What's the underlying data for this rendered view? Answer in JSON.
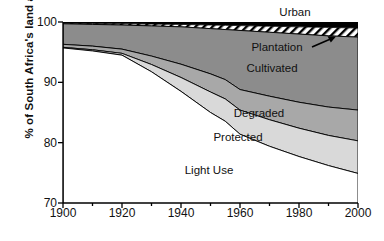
{
  "chart_data": {
    "type": "area",
    "title": "",
    "subtitle": "",
    "xlabel": "",
    "ylabel": "% of South Africa's land area",
    "xlim": [
      1900,
      2000
    ],
    "ylim": [
      70,
      100
    ],
    "grid": false,
    "legend_position": "inline-annotations",
    "stacked": true,
    "stack_order": "top-down",
    "x": [
      1900,
      1910,
      1920,
      1930,
      1940,
      1950,
      1955,
      1960,
      1970,
      1980,
      1990,
      2000
    ],
    "xticks": [
      1900,
      1920,
      1940,
      1960,
      1980,
      2000
    ],
    "xminorticks": [
      1910,
      1930,
      1950,
      1970,
      1990
    ],
    "yticks": [
      70,
      80,
      90,
      100
    ],
    "series": [
      {
        "name": "Urban",
        "color": "#000000",
        "pattern": "solid",
        "values": [
          0.2,
          0.25,
          0.3,
          0.35,
          0.4,
          0.5,
          0.55,
          0.6,
          0.7,
          0.8,
          0.9,
          1.0
        ]
      },
      {
        "name": "Plantation",
        "color": "#ffffff",
        "pattern": "diagonal-hatch",
        "values": [
          0.1,
          0.15,
          0.2,
          0.3,
          0.4,
          0.6,
          0.7,
          0.8,
          1.0,
          1.2,
          1.4,
          1.5
        ]
      },
      {
        "name": "Cultivated",
        "color": "#8c8c8c",
        "pattern": "solid",
        "values": [
          3.4,
          3.6,
          4.0,
          5.0,
          6.2,
          7.5,
          8.3,
          9.8,
          10.6,
          11.3,
          11.8,
          12.1
        ]
      },
      {
        "name": "Degraded",
        "color": "#a8a8a8",
        "pattern": "solid",
        "values": [
          0.5,
          0.6,
          0.7,
          1.4,
          2.2,
          3.0,
          3.2,
          3.4,
          3.9,
          4.3,
          4.7,
          5.1
        ]
      },
      {
        "name": "Protected",
        "color": "#d9d9d9",
        "pattern": "solid",
        "values": [
          0.1,
          0.2,
          0.3,
          1.2,
          2.3,
          3.4,
          3.7,
          4.0,
          4.4,
          4.7,
          5.0,
          5.4
        ]
      },
      {
        "name": "Light Use",
        "color": "#ffffff",
        "pattern": "solid",
        "values": [
          95.7,
          95.2,
          94.5,
          91.75,
          88.5,
          85.0,
          83.55,
          81.4,
          79.4,
          77.7,
          76.2,
          74.9
        ]
      }
    ],
    "boundaries_cumulative_from_top": {
      "urban_bottom": [
        99.8,
        99.75,
        99.7,
        99.65,
        99.6,
        99.5,
        99.45,
        99.4,
        99.3,
        99.2,
        99.1,
        99.0
      ],
      "plantation_bottom": [
        99.7,
        99.6,
        99.5,
        99.35,
        99.2,
        98.9,
        98.75,
        98.6,
        98.3,
        98.0,
        97.7,
        97.5
      ],
      "cultivated_bottom": [
        96.3,
        96.0,
        95.5,
        94.35,
        93.0,
        91.4,
        90.45,
        88.8,
        87.7,
        86.7,
        85.9,
        85.4
      ],
      "degraded_bottom": [
        95.8,
        95.4,
        94.8,
        92.95,
        90.8,
        88.4,
        87.25,
        85.4,
        83.8,
        82.4,
        81.2,
        80.3
      ],
      "protected_bottom": [
        95.7,
        95.2,
        94.5,
        91.75,
        88.5,
        85.0,
        83.55,
        81.4,
        79.4,
        77.7,
        76.2,
        74.9
      ]
    },
    "annotations": [
      {
        "text": "Urban",
        "x": 1978,
        "y": 101.6,
        "target": "urban-band"
      },
      {
        "text": "Plantation",
        "x": 1972,
        "y": 96.6,
        "target": "plantation-band",
        "arrow": true
      },
      {
        "text": "Cultivated",
        "x": 1963,
        "y": 92.7,
        "target": "cultivated-band"
      },
      {
        "text": "Degraded",
        "x": 1958,
        "y": 85.4,
        "target": "degraded-band"
      },
      {
        "text": "Protected",
        "x": 1950,
        "y": 81.6,
        "target": "protected-band"
      },
      {
        "text": "Light Use",
        "x": 1938,
        "y": 76.3,
        "target": "light-use-band"
      }
    ]
  },
  "axis": {
    "y_label": "% of South Africa's land area",
    "y_ticks": [
      "100",
      "90",
      "80",
      "70"
    ],
    "x_ticks": [
      "1900",
      "1920",
      "1940",
      "1960",
      "1980",
      "2000"
    ]
  },
  "labels": {
    "urban": "Urban",
    "plantation": "Plantation",
    "cultivated": "Cultivated",
    "degraded": "Degraded",
    "protected": "Protected",
    "light_use": "Light Use"
  },
  "colors": {
    "urban": "#000000",
    "plantation_fill": "#ffffff",
    "plantation_hatch": "#000000",
    "cultivated": "#8c8c8c",
    "degraded": "#a8a8a8",
    "protected": "#d9d9d9",
    "light_use": "#ffffff",
    "axis": "#000000",
    "text": "#111111"
  }
}
